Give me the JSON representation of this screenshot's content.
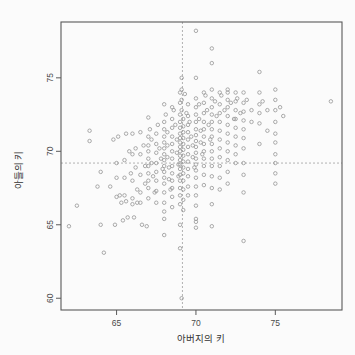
{
  "chart_data": {
    "type": "scatter",
    "title": "",
    "xlabel": "아버지의 키",
    "ylabel": "아들의 키",
    "xlim": [
      61.5,
      79.2
    ],
    "ylim": [
      59.2,
      78.8
    ],
    "xticks": [
      65,
      70,
      75
    ],
    "xticklabels": [
      "65",
      "70",
      "75"
    ],
    "yticks": [
      60,
      65,
      70,
      75
    ],
    "yticklabels": [
      "60",
      "65",
      "70",
      "75"
    ],
    "grid": false,
    "legend": null,
    "marker": "open-circle",
    "marker_color": "#9b9b9b",
    "frame_color": "#5a5a5a",
    "refline_color": "#a8a8a8",
    "reference_lines": [
      {
        "orientation": "vertical",
        "value": 69.15,
        "style": "dashed"
      },
      {
        "orientation": "horizontal",
        "value": 69.2,
        "style": "dashed"
      }
    ],
    "points": [
      [
        62.0,
        64.9
      ],
      [
        62.5,
        66.3
      ],
      [
        63.3,
        70.7
      ],
      [
        63.3,
        71.4
      ],
      [
        63.8,
        67.6
      ],
      [
        64.0,
        65.0
      ],
      [
        64.0,
        68.6
      ],
      [
        64.2,
        63.1
      ],
      [
        64.6,
        67.6
      ],
      [
        64.8,
        70.8
      ],
      [
        64.9,
        65.0
      ],
      [
        65.0,
        69.2
      ],
      [
        65.0,
        66.9
      ],
      [
        65.0,
        68.2
      ],
      [
        65.1,
        71.0
      ],
      [
        65.2,
        67.0
      ],
      [
        65.3,
        66.5
      ],
      [
        65.4,
        65.3
      ],
      [
        65.5,
        69.4
      ],
      [
        65.5,
        68.2
      ],
      [
        65.5,
        67.0
      ],
      [
        65.6,
        71.2
      ],
      [
        65.6,
        66.6
      ],
      [
        65.7,
        65.5
      ],
      [
        65.8,
        70.0
      ],
      [
        65.9,
        68.5
      ],
      [
        66.0,
        71.2
      ],
      [
        66.0,
        69.8
      ],
      [
        66.0,
        68.0
      ],
      [
        66.0,
        66.8
      ],
      [
        66.0,
        66.4
      ],
      [
        66.1,
        65.5
      ],
      [
        66.2,
        70.2
      ],
      [
        66.2,
        68.9
      ],
      [
        66.3,
        67.4
      ],
      [
        66.3,
        66.5
      ],
      [
        66.5,
        71.3
      ],
      [
        66.5,
        69.8
      ],
      [
        66.5,
        68.4
      ],
      [
        66.5,
        67.2
      ],
      [
        66.5,
        66.5
      ],
      [
        66.6,
        65.0
      ],
      [
        66.7,
        70.4
      ],
      [
        66.8,
        69.0
      ],
      [
        66.8,
        67.8
      ],
      [
        66.9,
        64.9
      ],
      [
        67.0,
        72.3
      ],
      [
        67.0,
        71.0
      ],
      [
        67.0,
        70.4
      ],
      [
        67.0,
        70.0
      ],
      [
        67.0,
        69.5
      ],
      [
        67.0,
        69.0
      ],
      [
        67.0,
        68.5
      ],
      [
        67.0,
        68.0
      ],
      [
        67.0,
        67.5
      ],
      [
        67.0,
        66.8
      ],
      [
        67.1,
        71.5
      ],
      [
        67.2,
        70.8
      ],
      [
        67.2,
        69.2
      ],
      [
        67.3,
        68.3
      ],
      [
        67.4,
        67.2
      ],
      [
        67.5,
        71.2
      ],
      [
        67.5,
        70.5
      ],
      [
        67.5,
        69.9
      ],
      [
        67.5,
        69.2
      ],
      [
        67.5,
        68.6
      ],
      [
        67.5,
        68.0
      ],
      [
        67.5,
        67.3
      ],
      [
        67.5,
        66.5
      ],
      [
        67.6,
        71.8
      ],
      [
        67.7,
        70.2
      ],
      [
        67.8,
        69.5
      ],
      [
        67.9,
        68.8
      ],
      [
        68.0,
        73.2
      ],
      [
        68.0,
        72.0
      ],
      [
        68.0,
        71.5
      ],
      [
        68.0,
        71.0
      ],
      [
        68.0,
        70.6
      ],
      [
        68.0,
        70.2
      ],
      [
        68.0,
        69.8
      ],
      [
        68.0,
        69.4
      ],
      [
        68.0,
        69.0
      ],
      [
        68.0,
        68.6
      ],
      [
        68.0,
        68.2
      ],
      [
        68.0,
        67.8
      ],
      [
        68.0,
        67.2
      ],
      [
        68.0,
        66.5
      ],
      [
        68.0,
        65.9
      ],
      [
        68.0,
        65.4
      ],
      [
        68.0,
        64.3
      ],
      [
        68.1,
        72.5
      ],
      [
        68.2,
        71.3
      ],
      [
        68.2,
        70.4
      ],
      [
        68.2,
        69.6
      ],
      [
        68.3,
        68.9
      ],
      [
        68.3,
        68.1
      ],
      [
        68.4,
        67.4
      ],
      [
        68.5,
        73.0
      ],
      [
        68.5,
        72.2
      ],
      [
        68.5,
        71.6
      ],
      [
        68.5,
        71.0
      ],
      [
        68.5,
        70.5
      ],
      [
        68.5,
        70.0
      ],
      [
        68.5,
        69.5
      ],
      [
        68.5,
        69.0
      ],
      [
        68.5,
        68.5
      ],
      [
        68.5,
        68.0
      ],
      [
        68.5,
        67.5
      ],
      [
        68.5,
        66.9
      ],
      [
        68.5,
        66.2
      ],
      [
        68.6,
        72.8
      ],
      [
        68.7,
        71.8
      ],
      [
        68.8,
        70.8
      ],
      [
        68.8,
        69.9
      ],
      [
        68.9,
        69.1
      ],
      [
        68.9,
        68.3
      ],
      [
        69.0,
        74.0
      ],
      [
        69.0,
        73.3
      ],
      [
        69.0,
        72.5
      ],
      [
        69.0,
        72.0
      ],
      [
        69.0,
        71.6
      ],
      [
        69.0,
        71.2
      ],
      [
        69.0,
        70.9
      ],
      [
        69.0,
        70.6
      ],
      [
        69.0,
        70.3
      ],
      [
        69.0,
        70.0
      ],
      [
        69.0,
        69.7
      ],
      [
        69.0,
        69.4
      ],
      [
        69.0,
        69.1
      ],
      [
        69.0,
        68.8
      ],
      [
        69.0,
        68.4
      ],
      [
        69.0,
        68.0
      ],
      [
        69.0,
        67.5
      ],
      [
        69.0,
        67.0
      ],
      [
        69.0,
        66.4
      ],
      [
        69.0,
        65.0
      ],
      [
        69.0,
        63.4
      ],
      [
        69.1,
        75.0
      ],
      [
        69.1,
        74.2
      ],
      [
        69.1,
        73.5
      ],
      [
        69.1,
        72.8
      ],
      [
        69.1,
        60.0
      ],
      [
        69.2,
        72.2
      ],
      [
        69.2,
        71.7
      ],
      [
        69.2,
        71.3
      ],
      [
        69.2,
        70.9
      ],
      [
        69.2,
        70.5
      ],
      [
        69.2,
        70.1
      ],
      [
        69.2,
        69.7
      ],
      [
        69.2,
        69.3
      ],
      [
        69.2,
        68.9
      ],
      [
        69.2,
        68.5
      ],
      [
        69.2,
        68.0
      ],
      [
        69.2,
        67.4
      ],
      [
        69.2,
        66.7
      ],
      [
        69.2,
        66.0
      ],
      [
        69.3,
        73.9
      ],
      [
        69.4,
        72.6
      ],
      [
        69.5,
        73.2
      ],
      [
        69.5,
        72.4
      ],
      [
        69.5,
        71.8
      ],
      [
        69.5,
        71.3
      ],
      [
        69.5,
        70.8
      ],
      [
        69.5,
        70.3
      ],
      [
        69.5,
        69.8
      ],
      [
        69.5,
        69.3
      ],
      [
        69.5,
        68.8
      ],
      [
        69.5,
        68.3
      ],
      [
        69.5,
        67.6
      ],
      [
        69.5,
        67.0
      ],
      [
        69.6,
        72.0
      ],
      [
        69.7,
        71.0
      ],
      [
        69.8,
        70.4
      ],
      [
        69.8,
        69.6
      ],
      [
        69.9,
        68.9
      ],
      [
        70.0,
        78.2
      ],
      [
        70.0,
        75.0
      ],
      [
        70.0,
        73.6
      ],
      [
        70.0,
        73.0
      ],
      [
        70.0,
        72.5
      ],
      [
        70.0,
        72.0
      ],
      [
        70.0,
        71.5
      ],
      [
        70.0,
        71.1
      ],
      [
        70.0,
        70.7
      ],
      [
        70.0,
        70.3
      ],
      [
        70.0,
        69.9
      ],
      [
        70.0,
        69.5
      ],
      [
        70.0,
        69.1
      ],
      [
        70.0,
        68.7
      ],
      [
        70.0,
        68.2
      ],
      [
        70.0,
        67.6
      ],
      [
        70.0,
        67.0
      ],
      [
        70.0,
        66.3
      ],
      [
        70.0,
        65.4
      ],
      [
        70.0,
        65.2
      ],
      [
        70.0,
        64.8
      ],
      [
        70.2,
        73.2
      ],
      [
        70.2,
        72.2
      ],
      [
        70.3,
        71.4
      ],
      [
        70.3,
        70.6
      ],
      [
        70.4,
        69.8
      ],
      [
        70.5,
        74.0
      ],
      [
        70.5,
        73.3
      ],
      [
        70.5,
        72.6
      ],
      [
        70.5,
        72.0
      ],
      [
        70.5,
        71.5
      ],
      [
        70.5,
        71.0
      ],
      [
        70.5,
        70.5
      ],
      [
        70.5,
        70.0
      ],
      [
        70.5,
        69.5
      ],
      [
        70.5,
        69.0
      ],
      [
        70.5,
        68.4
      ],
      [
        70.5,
        67.7
      ],
      [
        70.6,
        73.8
      ],
      [
        70.7,
        72.8
      ],
      [
        70.8,
        71.8
      ],
      [
        70.9,
        70.8
      ],
      [
        71.0,
        77.0
      ],
      [
        71.0,
        76.0
      ],
      [
        71.0,
        74.2
      ],
      [
        71.0,
        73.6
      ],
      [
        71.0,
        73.0
      ],
      [
        71.0,
        72.5
      ],
      [
        71.0,
        72.0
      ],
      [
        71.0,
        71.5
      ],
      [
        71.0,
        71.0
      ],
      [
        71.0,
        70.5
      ],
      [
        71.0,
        70.0
      ],
      [
        71.0,
        69.5
      ],
      [
        71.0,
        69.0
      ],
      [
        71.0,
        68.3
      ],
      [
        71.0,
        67.5
      ],
      [
        71.0,
        66.4
      ],
      [
        71.0,
        64.9
      ],
      [
        71.2,
        73.4
      ],
      [
        71.3,
        72.4
      ],
      [
        71.5,
        74.0
      ],
      [
        71.5,
        73.2
      ],
      [
        71.5,
        72.6
      ],
      [
        71.5,
        72.0
      ],
      [
        71.5,
        71.4
      ],
      [
        71.5,
        70.8
      ],
      [
        71.5,
        70.2
      ],
      [
        71.5,
        69.6
      ],
      [
        71.5,
        69.0
      ],
      [
        71.5,
        68.2
      ],
      [
        71.5,
        67.4
      ],
      [
        71.6,
        73.8
      ],
      [
        71.8,
        72.8
      ],
      [
        72.0,
        74.2
      ],
      [
        72.0,
        74.0
      ],
      [
        72.0,
        73.5
      ],
      [
        72.0,
        73.0
      ],
      [
        72.0,
        72.4
      ],
      [
        72.0,
        71.8
      ],
      [
        72.0,
        71.2
      ],
      [
        72.0,
        70.6
      ],
      [
        72.0,
        70.0
      ],
      [
        72.0,
        69.4
      ],
      [
        72.0,
        68.6
      ],
      [
        72.0,
        67.8
      ],
      [
        72.2,
        73.3
      ],
      [
        72.4,
        72.2
      ],
      [
        72.5,
        74.0
      ],
      [
        72.5,
        73.4
      ],
      [
        72.5,
        72.8
      ],
      [
        72.5,
        72.2
      ],
      [
        72.5,
        71.6
      ],
      [
        72.5,
        71.0
      ],
      [
        72.5,
        70.4
      ],
      [
        72.5,
        69.8
      ],
      [
        72.5,
        69.2
      ],
      [
        72.6,
        73.6
      ],
      [
        72.8,
        72.6
      ],
      [
        73.0,
        74.0
      ],
      [
        73.0,
        73.3
      ],
      [
        73.0,
        72.7
      ],
      [
        73.0,
        72.1
      ],
      [
        73.0,
        71.5
      ],
      [
        73.0,
        70.9
      ],
      [
        73.0,
        70.2
      ],
      [
        73.0,
        69.2
      ],
      [
        73.0,
        68.4
      ],
      [
        73.0,
        67.2
      ],
      [
        73.0,
        63.9
      ],
      [
        73.2,
        73.5
      ],
      [
        73.5,
        72.8
      ],
      [
        73.5,
        72.0
      ],
      [
        74.0,
        75.4
      ],
      [
        74.0,
        74.0
      ],
      [
        74.0,
        73.2
      ],
      [
        74.0,
        72.6
      ],
      [
        74.0,
        71.9
      ],
      [
        74.0,
        70.5
      ],
      [
        74.2,
        73.4
      ],
      [
        74.5,
        72.8
      ],
      [
        74.5,
        71.4
      ],
      [
        75.0,
        74.2
      ],
      [
        75.0,
        73.5
      ],
      [
        75.0,
        72.8
      ],
      [
        75.0,
        72.0
      ],
      [
        75.0,
        71.2
      ],
      [
        75.0,
        70.6
      ],
      [
        75.0,
        69.8
      ],
      [
        75.0,
        69.2
      ],
      [
        75.0,
        68.5
      ],
      [
        75.0,
        67.8
      ],
      [
        75.3,
        73.0
      ],
      [
        75.5,
        72.4
      ],
      [
        78.5,
        73.4
      ]
    ]
  },
  "figure": {
    "background_color": "#fbfbfb",
    "plot_area": {
      "left": 61,
      "top": 22,
      "right": 342,
      "bottom": 310
    }
  }
}
